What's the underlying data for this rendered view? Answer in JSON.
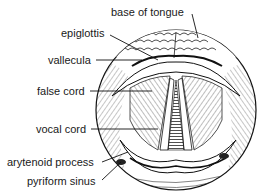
{
  "diagram": {
    "labels": {
      "base_of_tongue": "base of tongue",
      "epiglottis": "epiglottis",
      "vallecula": "vallecula",
      "false_cord": "false cord",
      "vocal_cord": "vocal cord",
      "arytenoid_process": "arytenoid process",
      "pyriform_sinus": "pyriform sinus"
    },
    "colors": {
      "ink": "#1a1a1a",
      "background": "#ffffff"
    }
  }
}
